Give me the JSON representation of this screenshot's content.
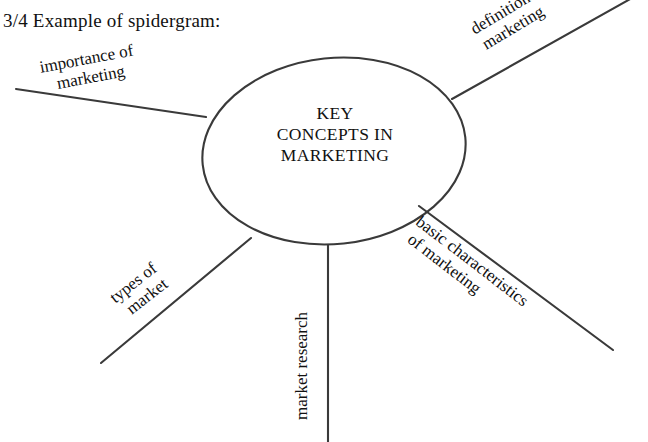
{
  "caption": "3/4 Example of spidergram:",
  "diagram": {
    "type": "spidergram",
    "center": {
      "lines": [
        "KEY",
        "CONCEPTS IN",
        "MARKETING"
      ],
      "text": "KEY CONCEPTS IN MARKETING"
    },
    "stroke_color": "#3a3a3a",
    "text_color": "#111111",
    "background": "#ffffff",
    "branches": [
      {
        "id": "importance-of-marketing",
        "text": "importance of marketing",
        "lines": [
          "importance of",
          "marketing"
        ],
        "direction": "upper-left",
        "rotation_deg": -10.5
      },
      {
        "id": "definition-of-marketing",
        "text": "definition of marketing",
        "lines": [
          "definition of",
          "marketing"
        ],
        "direction": "upper-right",
        "rotation_deg": -31
      },
      {
        "id": "basic-characteristics-of-marketing",
        "text": "basic characteristics of marketing",
        "lines": [
          "basic characteristics",
          "of marketing"
        ],
        "direction": "lower-right",
        "rotation_deg": 37.5
      },
      {
        "id": "market-research",
        "text": "market research",
        "lines": [
          "market research"
        ],
        "direction": "down",
        "rotation_deg": -90
      },
      {
        "id": "types-of-market",
        "text": "types of market",
        "lines": [
          "types of",
          "market"
        ],
        "direction": "lower-left",
        "rotation_deg": -38
      }
    ]
  }
}
